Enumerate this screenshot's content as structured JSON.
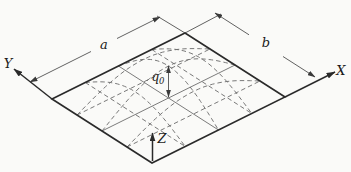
{
  "figure": {
    "labels": {
      "axis_x": "X",
      "axis_y": "Y",
      "axis_z": "Z",
      "dim_a": "a",
      "dim_b": "b",
      "load_symbol": "q",
      "load_subscript": "0"
    },
    "colors": {
      "outline": "#2a2a2a",
      "thin_line": "#3a3a3a",
      "dashed_line": "#6a6a6a",
      "background": "#fafaf8"
    }
  }
}
